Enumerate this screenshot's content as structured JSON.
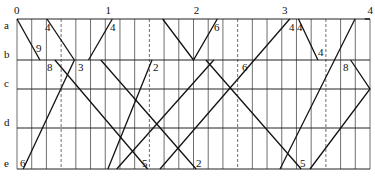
{
  "diagram": {
    "type": "train-timetable-diagram",
    "hour_labels": [
      "0",
      "1",
      "2",
      "3",
      "4"
    ],
    "station_labels": [
      "a",
      "b",
      "c",
      "d",
      "e"
    ],
    "layout": {
      "x0": 17,
      "px_per_hour": 88.25,
      "subdivisions_per_hour": 6,
      "dashed_at_half_hour": true,
      "station_y": {
        "a": 19,
        "b": 60,
        "c": 89,
        "d": 128,
        "e": 169
      }
    },
    "trains": [
      {
        "points": [
          [
            0.0,
            "a"
          ],
          [
            0.26,
            "b"
          ]
        ],
        "labels": [
          {
            "text": "9",
            "x": 36,
            "y": 52
          }
        ]
      },
      {
        "points": [
          [
            0.34,
            "a"
          ],
          [
            0.65,
            "b"
          ]
        ],
        "labels": [
          {
            "text": "4",
            "x": 45,
            "y": 31
          }
        ]
      },
      {
        "points": [
          [
            0.43,
            "b"
          ],
          [
            1.48,
            "e"
          ]
        ],
        "labels": [
          {
            "text": "8",
            "x": 47,
            "y": 71
          },
          {
            "text": "5",
            "x": 142,
            "y": 167
          }
        ]
      },
      {
        "points": [
          [
            0.07,
            "e"
          ],
          [
            0.65,
            "b"
          ]
        ],
        "labels": [
          {
            "text": "6",
            "x": 20,
            "y": 167
          },
          {
            "text": "3",
            "x": 78,
            "y": 71
          }
        ]
      },
      {
        "points": [
          [
            0.81,
            "b"
          ],
          [
            1.08,
            "a"
          ]
        ],
        "labels": [
          {
            "text": "4",
            "x": 110,
            "y": 31
          }
        ]
      },
      {
        "points": [
          [
            0.95,
            "b"
          ],
          [
            2.03,
            "e"
          ]
        ],
        "labels": [
          {
            "text": "2",
            "x": 196,
            "y": 167
          }
        ]
      },
      {
        "points": [
          [
            1.03,
            "e"
          ],
          [
            1.53,
            "b"
          ]
        ],
        "labels": [
          {
            "text": "2",
            "x": 153,
            "y": 71
          }
        ]
      },
      {
        "points": [
          [
            1.13,
            "e"
          ],
          [
            2.23,
            "b"
          ]
        ],
        "labels": [
          {
            "text": "6",
            "x": 242,
            "y": 71
          }
        ]
      },
      {
        "points": [
          [
            1.65,
            "a"
          ],
          [
            2.0,
            "b"
          ],
          [
            2.27,
            "a"
          ]
        ],
        "labels": [
          {
            "text": "6",
            "x": 214,
            "y": 31
          }
        ]
      },
      {
        "points": [
          [
            2.14,
            "b"
          ],
          [
            3.22,
            "e"
          ]
        ],
        "labels": [
          {
            "text": "5",
            "x": 300,
            "y": 167
          }
        ]
      },
      {
        "points": [
          [
            1.62,
            "e"
          ],
          [
            3.09,
            "a"
          ]
        ],
        "labels": [
          {
            "text": "4",
            "x": 289,
            "y": 31
          }
        ]
      },
      {
        "points": [
          [
            3.19,
            "a"
          ],
          [
            3.41,
            "b"
          ]
        ],
        "labels": [
          {
            "text": "4",
            "x": 297,
            "y": 31
          },
          {
            "text": "4",
            "x": 318,
            "y": 56
          }
        ]
      },
      {
        "points": [
          [
            2.98,
            "e"
          ],
          [
            3.83,
            "a"
          ]
        ],
        "labels": []
      },
      {
        "points": [
          [
            3.32,
            "e"
          ],
          [
            4.0,
            "c"
          ],
          [
            3.78,
            "b"
          ]
        ],
        "labels": [
          {
            "text": "8",
            "x": 343,
            "y": 71
          }
        ]
      },
      {
        "points": [
          [
            3.94,
            "a"
          ],
          [
            4.0,
            "a"
          ]
        ],
        "labels": []
      }
    ]
  }
}
